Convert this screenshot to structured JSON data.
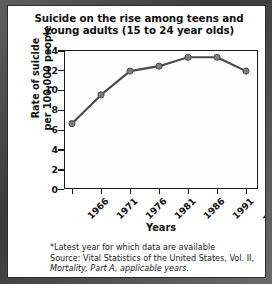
{
  "chart_data": {
    "type": "line",
    "title": "Suicide on the rise among teens and young adults (15 to 24 year olds)",
    "title_lines": [
      "Suicide on the rise among teens and",
      "young adults (15 to 24 year olds)"
    ],
    "xlabel": "Years",
    "ylabel": "Rate of suicide per 100,000 people",
    "ylabel_lines": [
      "Rate of suicide",
      "per 100,000 people"
    ],
    "categories": [
      "1966",
      "1971",
      "1976",
      "1981",
      "1986",
      "1991",
      "1996*"
    ],
    "x": [
      1966,
      1971,
      1976,
      1981,
      1986,
      1991,
      1996
    ],
    "values": [
      6.6,
      9.5,
      11.9,
      12.4,
      13.3,
      13.3,
      11.9
    ],
    "ylim": [
      0,
      14
    ],
    "xlim": [
      1964,
      1998
    ],
    "ytick_labels": [
      "0",
      "2",
      "4",
      "6",
      "8",
      "10",
      "12",
      "14"
    ],
    "ytick_values": [
      0,
      2,
      4,
      6,
      8,
      10,
      12,
      14
    ],
    "grid": false,
    "legend": false,
    "series_color": "#4a4a4a",
    "marker_color": "#7d7d7d",
    "axis_color": "#1b1b1b"
  },
  "footnote": {
    "lines": [
      "*Latest year for which data are available",
      "Source: Vital Statistics of the United States, Vol. II,",
      "Mortality, Part A, applicable years."
    ],
    "line1": "*Latest year for which data are available",
    "line2": "Source: Vital Statistics of the United States, Vol. II,",
    "line3": "Mortality, Part A, applicable years."
  }
}
